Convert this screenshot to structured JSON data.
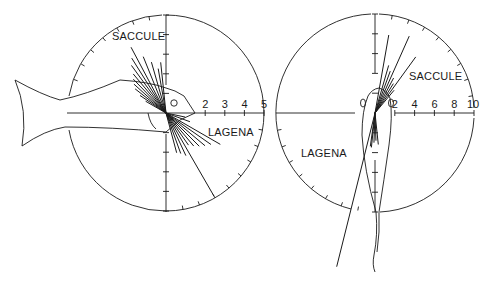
{
  "figure": {
    "colors": {
      "ink": "#1a1a1a",
      "background": "#ffffff"
    },
    "left_panel": {
      "center": [
        166,
        113
      ],
      "radius": 98,
      "labels": {
        "upper": "SACCULE",
        "lower": "LAGENA"
      },
      "axis_ticks": [
        "2",
        "3",
        "4",
        "5"
      ],
      "axis_tick_values": [
        2,
        3,
        4,
        5
      ],
      "axis_max": 5,
      "subject": "fish-side-view",
      "saccule_vector_angles_deg": [
        118,
        122,
        126,
        130,
        134,
        138,
        142,
        146,
        150,
        112,
        106,
        100,
        96
      ],
      "saccule_vector_lengths": [
        3.8,
        3.3,
        3.0,
        2.6,
        2.4,
        2.2,
        2.0,
        1.6,
        1.2,
        3.1,
        2.7,
        2.3,
        2.6
      ],
      "lagena_vector_angles_deg": [
        -30,
        -35,
        -40,
        -45,
        -50,
        -55,
        -60,
        -65,
        -70,
        -75,
        -20,
        -12
      ],
      "lagena_vector_lengths": [
        3.2,
        2.8,
        2.6,
        2.4,
        2.2,
        2.0,
        4.9,
        2.4,
        2.2,
        2.1,
        1.3,
        1.0
      ]
    },
    "right_panel": {
      "center": [
        375,
        113
      ],
      "radius": 99,
      "labels": {
        "upper": "SACCULE",
        "lower": "LAGENA"
      },
      "axis_ticks": [
        "2",
        "4",
        "6",
        "8",
        "10"
      ],
      "axis_tick_values": [
        2,
        4,
        6,
        8,
        10
      ],
      "axis_max": 10,
      "subject": "fish-top-view",
      "saccule_vector_angles_deg": [
        80,
        74,
        70,
        66,
        62,
        58,
        54,
        50
      ],
      "saccule_vector_lengths": [
        8.0,
        5.0,
        4.5,
        8.5,
        4.0,
        3.5,
        7.0,
        3.0
      ],
      "lagena_vector_angles_deg": [
        -104,
        -96,
        -92,
        -88,
        -84,
        -98
      ],
      "lagena_vector_lengths": [
        16.0,
        3.5,
        3.0,
        2.8,
        3.2,
        3.4
      ]
    }
  }
}
